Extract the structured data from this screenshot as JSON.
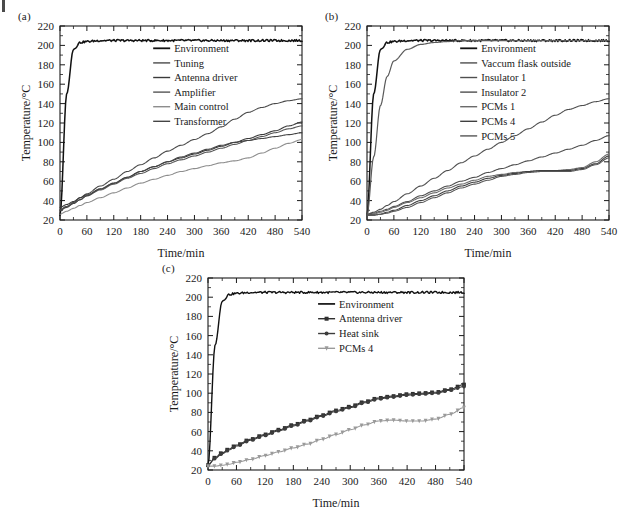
{
  "figure": {
    "panels": [
      {
        "id": "a",
        "label": "(a)",
        "xlabel": "Time/min",
        "ylabel": "Temperature/°C"
      },
      {
        "id": "b",
        "label": "(b)",
        "xlabel": "Time/min",
        "ylabel": "Temperature/°C"
      },
      {
        "id": "c",
        "label": "(c)",
        "xlabel": "Time/min",
        "ylabel": "Temperature/°C"
      }
    ]
  },
  "chart_data": [
    {
      "panel": "a",
      "type": "line",
      "title": "(a)",
      "xlabel": "Time/min",
      "ylabel": "Temperature/°C",
      "xlim": [
        0,
        540
      ],
      "ylim": [
        20,
        220
      ],
      "xticks": [
        0,
        60,
        120,
        180,
        240,
        300,
        360,
        420,
        480,
        540
      ],
      "yticks": [
        20,
        40,
        60,
        80,
        100,
        120,
        140,
        160,
        180,
        200,
        220
      ],
      "grid": false,
      "legend_position": "upper-right-inside",
      "x": [
        0,
        15,
        30,
        45,
        60,
        90,
        120,
        150,
        180,
        210,
        240,
        270,
        300,
        330,
        360,
        390,
        420,
        450,
        480,
        510,
        540
      ],
      "series": [
        {
          "name": "Environment",
          "color": "#111111",
          "width": 1.5,
          "values": [
            25,
            150,
            196,
            203,
            204,
            205,
            205,
            205,
            205,
            205,
            205,
            205,
            205,
            205,
            205,
            205,
            205,
            205,
            205,
            205,
            205
          ]
        },
        {
          "name": "Tuning",
          "color": "#4a4a4a",
          "width": 1.1,
          "values": [
            30,
            34,
            38,
            43,
            47,
            55,
            62,
            70,
            77,
            84,
            91,
            97,
            103,
            109,
            116,
            124,
            131,
            136,
            140,
            143,
            145
          ]
        },
        {
          "name": "Antenna driver",
          "color": "#3a3a3a",
          "width": 1.1,
          "values": [
            33,
            36,
            39,
            43,
            46,
            52,
            58,
            64,
            70,
            75,
            80,
            84,
            88,
            92,
            96,
            100,
            104,
            108,
            112,
            117,
            121
          ]
        },
        {
          "name": "Amplifier",
          "color": "#555555",
          "width": 1.1,
          "values": [
            31,
            34,
            37,
            41,
            45,
            51,
            57,
            63,
            68,
            73,
            78,
            82,
            86,
            90,
            94,
            98,
            102,
            106,
            110,
            114,
            117
          ]
        },
        {
          "name": "Main control",
          "color": "#8d8d8d",
          "width": 1.1,
          "values": [
            26,
            29,
            32,
            35,
            38,
            43,
            48,
            53,
            58,
            62,
            66,
            70,
            73,
            76,
            79,
            81,
            84,
            89,
            94,
            99,
            103
          ]
        },
        {
          "name": "Transformer",
          "color": "#444444",
          "width": 1.1,
          "values": [
            30,
            33,
            37,
            41,
            45,
            52,
            58,
            64,
            70,
            75,
            80,
            85,
            89,
            93,
            97,
            100,
            102,
            104,
            106,
            108,
            110
          ]
        }
      ]
    },
    {
      "panel": "b",
      "type": "line",
      "title": "(b)",
      "xlabel": "Time/min",
      "ylabel": "Temperature/°C",
      "xlim": [
        0,
        540
      ],
      "ylim": [
        20,
        220
      ],
      "xticks": [
        0,
        60,
        120,
        180,
        240,
        300,
        360,
        420,
        480,
        540
      ],
      "yticks": [
        20,
        40,
        60,
        80,
        100,
        120,
        140,
        160,
        180,
        200,
        220
      ],
      "grid": false,
      "legend_position": "upper-right-inside",
      "x": [
        0,
        15,
        30,
        45,
        60,
        90,
        120,
        150,
        180,
        210,
        240,
        270,
        300,
        330,
        360,
        390,
        420,
        450,
        480,
        510,
        540
      ],
      "series": [
        {
          "name": "Environment",
          "color": "#111111",
          "width": 1.5,
          "values": [
            25,
            150,
            196,
            203,
            204,
            205,
            205,
            205,
            205,
            205,
            205,
            205,
            205,
            205,
            205,
            205,
            205,
            205,
            205,
            205,
            205
          ]
        },
        {
          "name": "Vaccum flask outside",
          "color": "#5a5a5a",
          "width": 1.2,
          "values": [
            25,
            85,
            138,
            168,
            184,
            196,
            201,
            203,
            204,
            205,
            205,
            205,
            205,
            205,
            205,
            205,
            205,
            205,
            205,
            205,
            205
          ]
        },
        {
          "name": "Insulator 1",
          "color": "#4f4f4f",
          "width": 1.1,
          "values": [
            26,
            28,
            31,
            35,
            39,
            47,
            55,
            63,
            71,
            79,
            86,
            93,
            100,
            107,
            114,
            121,
            128,
            134,
            138,
            142,
            145
          ]
        },
        {
          "name": "Insulator 2",
          "color": "#4f4f4f",
          "width": 1.1,
          "values": [
            26,
            27,
            29,
            31,
            34,
            39,
            45,
            50,
            55,
            60,
            64,
            69,
            73,
            77,
            81,
            85,
            89,
            93,
            97,
            102,
            107
          ]
        },
        {
          "name": "PCMs 1",
          "color": "#6b6b6b",
          "width": 1.1,
          "values": [
            25,
            26,
            28,
            30,
            33,
            38,
            43,
            48,
            53,
            57,
            61,
            65,
            67,
            69,
            70,
            71,
            71,
            72,
            74,
            80,
            88
          ]
        },
        {
          "name": "PCMs 4",
          "color": "#3f3f3f",
          "width": 1.1,
          "values": [
            25,
            25,
            26,
            28,
            30,
            35,
            40,
            45,
            50,
            55,
            59,
            63,
            66,
            68,
            70,
            71,
            71,
            71,
            73,
            78,
            86
          ]
        },
        {
          "name": "PCMs 5",
          "color": "#565656",
          "width": 1.1,
          "values": [
            25,
            25,
            26,
            27,
            29,
            33,
            38,
            43,
            48,
            53,
            57,
            61,
            65,
            67,
            69,
            70,
            70,
            70,
            72,
            77,
            84
          ]
        }
      ]
    },
    {
      "panel": "c",
      "type": "line",
      "title": "(c)",
      "xlabel": "Time/min",
      "ylabel": "Temperature/°C",
      "xlim": [
        0,
        540
      ],
      "ylim": [
        20,
        220
      ],
      "xticks": [
        0,
        60,
        120,
        180,
        240,
        300,
        360,
        420,
        480,
        540
      ],
      "yticks": [
        20,
        40,
        60,
        80,
        100,
        120,
        140,
        160,
        180,
        200,
        220
      ],
      "grid": false,
      "legend_position": "upper-right-inside",
      "x": [
        0,
        15,
        30,
        45,
        60,
        90,
        120,
        150,
        180,
        210,
        240,
        270,
        300,
        330,
        360,
        390,
        420,
        450,
        480,
        510,
        540
      ],
      "series": [
        {
          "name": "Environment",
          "color": "#111111",
          "width": 1.4,
          "marker": "none",
          "values": [
            25,
            150,
            196,
            203,
            204,
            205,
            205,
            205,
            205,
            205,
            205,
            205,
            205,
            205,
            205,
            205,
            205,
            205,
            205,
            205,
            205
          ]
        },
        {
          "name": "Antenna driver",
          "color": "#303030",
          "width": 1.1,
          "marker": "square",
          "values": [
            25,
            33,
            38,
            42,
            46,
            52,
            57,
            62,
            67,
            72,
            77,
            82,
            86,
            91,
            95,
            97,
            99,
            100,
            101,
            104,
            109
          ]
        },
        {
          "name": "Heat sink",
          "color": "#3c3c3c",
          "width": 1.1,
          "marker": "circle",
          "values": [
            25,
            32,
            37,
            41,
            45,
            51,
            56,
            61,
            66,
            71,
            76,
            81,
            85,
            90,
            94,
            96,
            98,
            99,
            100,
            103,
            107
          ]
        },
        {
          "name": "PCMs 4",
          "color": "#9a9a9a",
          "width": 1.1,
          "marker": "triangle-down",
          "values": [
            24,
            24,
            25,
            26,
            28,
            31,
            35,
            39,
            43,
            47,
            52,
            57,
            62,
            67,
            71,
            72,
            71,
            71,
            73,
            78,
            85
          ]
        }
      ]
    }
  ]
}
